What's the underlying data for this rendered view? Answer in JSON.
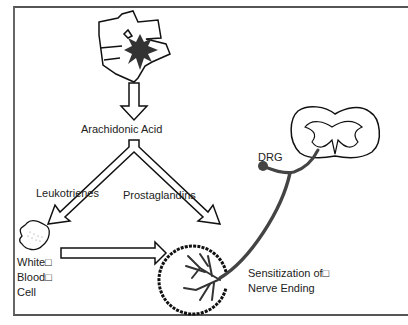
{
  "labels": {
    "arachidonic_acid": "Arachidonic Acid",
    "leukotrienes": "Leukotrienes",
    "prostaglandins": "Prostaglandins",
    "dRG": "DRG",
    "wbc_line1": "White□",
    "wbc_line2": "Blood□",
    "wbc_line3": "Cell",
    "sens_line1": "Sensitization of□",
    "sens_line2": "Nerve Ending"
  },
  "colors": {
    "line": "#111111",
    "nerve": "#444444",
    "frame": "#555555"
  }
}
